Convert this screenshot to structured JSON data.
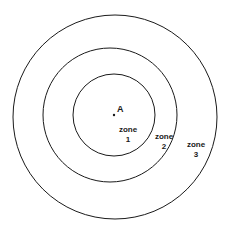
{
  "diagram": {
    "type": "concentric-zones",
    "center_point": {
      "label": "A"
    },
    "zones": [
      {
        "name": "zone",
        "number": "1"
      },
      {
        "name": "zone",
        "number": "2"
      },
      {
        "name": "zone",
        "number": "3"
      }
    ],
    "colors": {
      "stroke": "#1a1a1a",
      "background": "#ffffff"
    }
  }
}
